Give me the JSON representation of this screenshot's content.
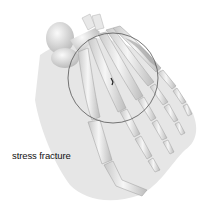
{
  "figure": {
    "label": "stress fracture",
    "colors": {
      "background": "#ffffff",
      "shadow": "#e4e4e4",
      "bone_light": "#f2f2f2",
      "bone_shade": "#bdbdbd",
      "circle_outline": "#555555",
      "fracture_mark": "#222222"
    }
  }
}
